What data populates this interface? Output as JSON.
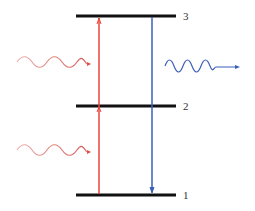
{
  "diagram": {
    "type": "energy-level-diagram",
    "levels": [
      {
        "label": "3",
        "y": 16
      },
      {
        "label": "2",
        "y": 106
      },
      {
        "label": "1",
        "y": 195
      }
    ],
    "transitions": [
      {
        "name": "absorption",
        "direction": "up",
        "from": "1",
        "to": "3",
        "color": "#e8453c"
      },
      {
        "name": "emission",
        "direction": "down",
        "from": "3",
        "to": "1",
        "color": "#3b5fb8"
      }
    ],
    "photons": [
      {
        "name": "incoming-photon-upper",
        "color": "#d9534f",
        "wavelength": "long"
      },
      {
        "name": "incoming-photon-lower",
        "color": "#d9534f",
        "wavelength": "long"
      },
      {
        "name": "emitted-photon",
        "color": "#3b5fb8",
        "wavelength": "short"
      }
    ],
    "colors": {
      "level": "#111111",
      "absorb": "#e8453c",
      "emit": "#3b5fb8"
    }
  }
}
